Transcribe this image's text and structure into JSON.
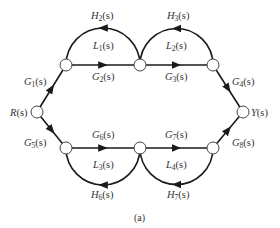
{
  "figure": {
    "caption": "(a)",
    "type": "signal-flow-graph",
    "colors": {
      "edge": "#1a1a1a",
      "node_stroke": "#444444",
      "text": "#333333"
    }
  },
  "nodes": [
    {
      "id": "R",
      "label": "R(s)",
      "x": 37,
      "y": 112
    },
    {
      "id": "T1",
      "x": 66,
      "y": 65
    },
    {
      "id": "T2",
      "x": 140,
      "y": 65
    },
    {
      "id": "T3",
      "x": 213,
      "y": 65
    },
    {
      "id": "Y",
      "label": "Y(s)",
      "x": 243,
      "y": 112
    },
    {
      "id": "B1",
      "x": 66,
      "y": 148
    },
    {
      "id": "B2",
      "x": 140,
      "y": 148
    },
    {
      "id": "B3",
      "x": 213,
      "y": 148
    }
  ],
  "labels": {
    "R": {
      "main": "R",
      "sub": "",
      "arg": "(s)"
    },
    "Y": {
      "main": "Y",
      "sub": "",
      "arg": "(s)"
    },
    "G1": {
      "main": "G",
      "sub": "1",
      "arg": "(s)"
    },
    "G2": {
      "main": "G",
      "sub": "2",
      "arg": "(s)"
    },
    "G3": {
      "main": "G",
      "sub": "3",
      "arg": "(s)"
    },
    "G4": {
      "main": "G",
      "sub": "4",
      "arg": "(s)"
    },
    "G5": {
      "main": "G",
      "sub": "5",
      "arg": "(s)"
    },
    "G6": {
      "main": "G",
      "sub": "6",
      "arg": "(s)"
    },
    "G7": {
      "main": "G",
      "sub": "7",
      "arg": "(s)"
    },
    "G8": {
      "main": "G",
      "sub": "8",
      "arg": "(s)"
    },
    "H2": {
      "main": "H",
      "sub": "2",
      "arg": "(s)"
    },
    "H3": {
      "main": "H",
      "sub": "3",
      "arg": "(s)"
    },
    "H6": {
      "main": "H",
      "sub": "6",
      "arg": "(s)"
    },
    "H7": {
      "main": "H",
      "sub": "7",
      "arg": "(s)"
    },
    "L1": {
      "main": "L",
      "sub": "1",
      "arg": "(s)"
    },
    "L2": {
      "main": "L",
      "sub": "2",
      "arg": "(s)"
    },
    "L3": {
      "main": "L",
      "sub": "3",
      "arg": "(s)"
    },
    "L4": {
      "main": "L",
      "sub": "4",
      "arg": "(s)"
    }
  },
  "edges": [
    {
      "from": "R",
      "to": "T1",
      "gain": "G1(s)"
    },
    {
      "from": "T1",
      "to": "T2",
      "gain": "G2(s)"
    },
    {
      "from": "T2",
      "to": "T3",
      "gain": "G3(s)"
    },
    {
      "from": "T3",
      "to": "Y",
      "gain": "G4(s)"
    },
    {
      "from": "R",
      "to": "B1",
      "gain": "G5(s)"
    },
    {
      "from": "B1",
      "to": "B2",
      "gain": "G6(s)"
    },
    {
      "from": "B2",
      "to": "B3",
      "gain": "G7(s)"
    },
    {
      "from": "B3",
      "to": "Y",
      "gain": "G8(s)"
    },
    {
      "from": "T2",
      "to": "T1",
      "gain": "H2(s)",
      "loop": "L1(s)"
    },
    {
      "from": "T3",
      "to": "T2",
      "gain": "H3(s)",
      "loop": "L2(s)"
    },
    {
      "from": "B2",
      "to": "B1",
      "gain": "H6(s)",
      "loop": "L3(s)"
    },
    {
      "from": "B3",
      "to": "B2",
      "gain": "H7(s)",
      "loop": "L4(s)"
    }
  ]
}
